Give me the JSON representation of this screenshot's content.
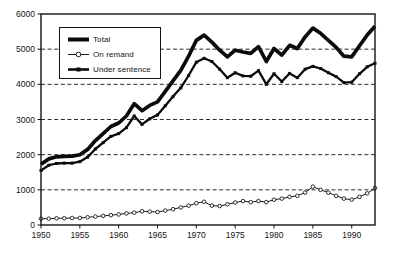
{
  "chart_data": {
    "type": "line",
    "title": "",
    "xlabel": "",
    "ylabel": "",
    "xlim": [
      1950,
      1993
    ],
    "ylim": [
      0,
      6000
    ],
    "x_ticks": [
      1950,
      1955,
      1960,
      1965,
      1970,
      1975,
      1980,
      1985,
      1990
    ],
    "y_ticks": [
      0,
      1000,
      2000,
      3000,
      4000,
      5000,
      6000
    ],
    "grid": "horizontal-dashed",
    "legend_position": "top-left-inside",
    "frame": "full-box",
    "line_color": "#141414",
    "years": [
      1950,
      1951,
      1952,
      1953,
      1954,
      1955,
      1956,
      1957,
      1958,
      1959,
      1960,
      1961,
      1962,
      1963,
      1964,
      1965,
      1966,
      1967,
      1968,
      1969,
      1970,
      1971,
      1972,
      1973,
      1974,
      1975,
      1976,
      1977,
      1978,
      1979,
      1980,
      1981,
      1982,
      1983,
      1984,
      1985,
      1986,
      1987,
      1988,
      1989,
      1990,
      1991,
      1992,
      1993
    ],
    "series": [
      {
        "name": "Total",
        "style": "thick-solid-line",
        "marker": "none",
        "color": "#0b0b0b",
        "values": [
          1730,
          1880,
          1940,
          1950,
          1960,
          2000,
          2150,
          2400,
          2600,
          2800,
          2900,
          3100,
          3450,
          3250,
          3400,
          3500,
          3800,
          4100,
          4400,
          4800,
          5250,
          5400,
          5200,
          4970,
          4780,
          4970,
          4920,
          4880,
          5070,
          4650,
          5020,
          4830,
          5110,
          5020,
          5350,
          5600,
          5450,
          5250,
          5050,
          4800,
          4780,
          5100,
          5400,
          5650
        ]
      },
      {
        "name": "On remand",
        "style": "thin-line",
        "marker": "open-circle",
        "color": "#1a1a1a",
        "values": [
          180,
          180,
          190,
          190,
          200,
          200,
          220,
          240,
          260,
          280,
          300,
          330,
          350,
          390,
          380,
          370,
          410,
          450,
          500,
          550,
          620,
          660,
          550,
          540,
          590,
          640,
          680,
          650,
          680,
          650,
          720,
          750,
          800,
          830,
          920,
          1090,
          1000,
          920,
          830,
          750,
          720,
          800,
          900,
          1050
        ]
      },
      {
        "name": "Under sentence",
        "style": "medium-solid-line",
        "marker": "filled-square",
        "color": "#0b0b0b",
        "values": [
          1550,
          1700,
          1750,
          1760,
          1760,
          1800,
          1930,
          2160,
          2340,
          2520,
          2600,
          2770,
          3100,
          2860,
          3020,
          3130,
          3390,
          3650,
          3900,
          4250,
          4630,
          4740,
          4650,
          4430,
          4190,
          4330,
          4240,
          4230,
          4390,
          4000,
          4300,
          4080,
          4310,
          4190,
          4430,
          4510,
          4450,
          4330,
          4220,
          4050,
          4060,
          4300,
          4500,
          4600
        ]
      }
    ]
  }
}
